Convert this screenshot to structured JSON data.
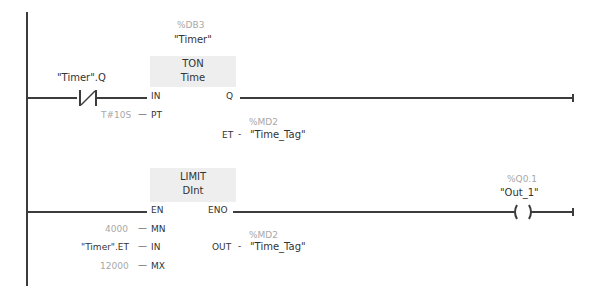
{
  "network": {
    "rung1": {
      "contact": {
        "type": "normally-closed-contact",
        "tag": "\"Timer\".Q"
      },
      "instruction": {
        "instance_address": "%DB3",
        "instance_name": "\"Timer\"",
        "name": "TON",
        "type": "Time",
        "pins": {
          "in_label": "IN",
          "pt_label": "PT",
          "q_label": "Q",
          "et_label": "ET"
        },
        "pt_value": "T#10S",
        "et_address": "%MD2",
        "et_tag": "\"Time_Tag\""
      }
    },
    "rung2": {
      "instruction": {
        "name": "LIMIT",
        "type": "DInt",
        "pins": {
          "en_label": "EN",
          "eno_label": "ENO",
          "mn_label": "MN",
          "in_label": "IN",
          "mx_label": "MX",
          "out_label": "OUT"
        },
        "mn_value": "4000",
        "in_value": "\"Timer\".ET",
        "mx_value": "12000",
        "out_address": "%MD2",
        "out_tag": "\"Time_Tag\""
      },
      "coil": {
        "type": "output-coil",
        "address": "%Q0.1",
        "tag": "\"Out_1\""
      }
    },
    "connector_dash": "—",
    "connector_short": "-",
    "colors": {
      "wire": "#3c3c3c",
      "header_fill": "#eeeeee",
      "address_text": "#a8a8a8",
      "tag_text": "#333333"
    }
  }
}
